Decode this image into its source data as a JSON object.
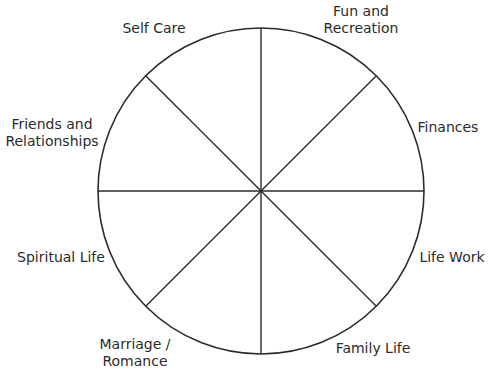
{
  "diagram": {
    "type": "wheel",
    "colors": {
      "line": "#2b2b2b",
      "background": "#ffffff",
      "text": "#2b2b2b"
    },
    "circle": {
      "cx": 261,
      "cy": 191,
      "r": 163
    },
    "segments": 8,
    "labels": {
      "self_care": {
        "line1": "Self Care"
      },
      "fun_recreation": {
        "line1": "Fun and",
        "line2": "Recreation"
      },
      "friends_relationships": {
        "line1": "Friends and",
        "line2": "Relationships"
      },
      "finances": {
        "line1": "Finances"
      },
      "spiritual_life": {
        "line1": "Spiritual Life"
      },
      "life_work": {
        "line1": "Life Work"
      },
      "marriage_romance": {
        "line1": "Marriage /",
        "line2": "Romance"
      },
      "family_life": {
        "line1": "Family Life"
      }
    }
  }
}
